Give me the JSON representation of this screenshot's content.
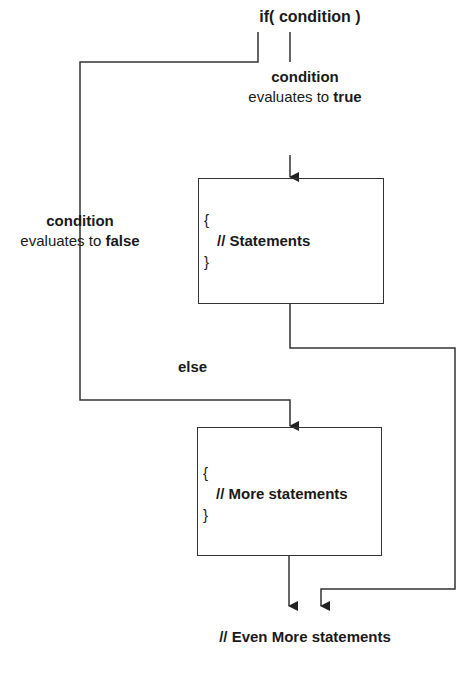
{
  "diagram": {
    "title": "if( condition )",
    "true_branch": {
      "label_bold": "condition",
      "label_prefix": "evaluates to ",
      "label_value": "true"
    },
    "false_branch": {
      "label_bold": "condition",
      "label_prefix": "evaluates to ",
      "label_value": "false"
    },
    "else_label": "else",
    "box_true": {
      "open": "{",
      "statement": "// Statements",
      "close": "}"
    },
    "box_false": {
      "open": "{",
      "statement": "// More statements",
      "close": "}"
    },
    "footer": "// Even More statements",
    "line_color": "#333333"
  }
}
